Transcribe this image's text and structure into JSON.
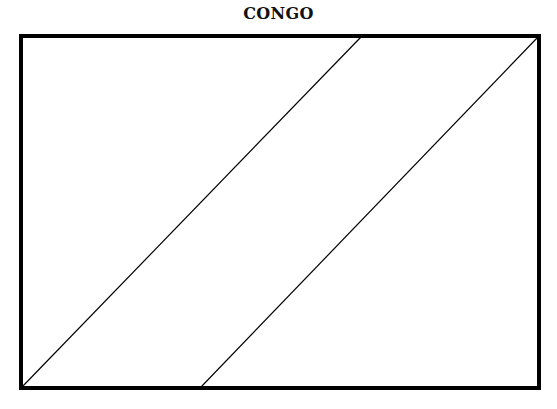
{
  "title": "CONGO",
  "flag": {
    "frame": {
      "x": 21,
      "y": 36,
      "width": 518,
      "height": 352,
      "stroke": "#000000",
      "stroke_width": 4
    },
    "diagonals": [
      {
        "x1": 22,
        "y1": 387,
        "x2": 361,
        "y2": 37
      },
      {
        "x1": 201,
        "y1": 387,
        "x2": 538,
        "y2": 37
      }
    ],
    "line_color": "#000000",
    "fill": "#ffffff"
  }
}
